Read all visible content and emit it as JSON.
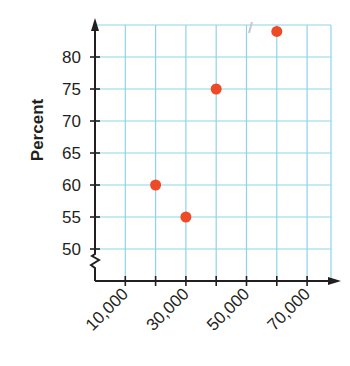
{
  "chart_data": {
    "type": "scatter",
    "title": "",
    "xlabel": "",
    "ylabel": "Percent",
    "x_tick_labels": [
      "10,000",
      "30,000",
      "50,000",
      "70,000"
    ],
    "x_tick_values": [
      10000,
      20000,
      30000,
      40000,
      50000,
      60000,
      70000
    ],
    "y_tick_labels": [
      "50",
      "55",
      "60",
      "65",
      "70",
      "75",
      "80"
    ],
    "y_tick_values": [
      50,
      55,
      60,
      65,
      70,
      75,
      80
    ],
    "xlim": [
      0,
      80000
    ],
    "ylim": [
      45,
      85
    ],
    "y_axis_break": true,
    "grid": true,
    "legend": null,
    "series": [
      {
        "name": "data",
        "color": "#ef4a26",
        "points": [
          {
            "x": 20000,
            "y": 60
          },
          {
            "x": 30000,
            "y": 55
          },
          {
            "x": 40000,
            "y": 75
          },
          {
            "x": 60000,
            "y": 84
          }
        ]
      }
    ]
  },
  "colors": {
    "grid": "#8fd3ea",
    "axis": "#231f20",
    "point": "#ef4a26"
  }
}
